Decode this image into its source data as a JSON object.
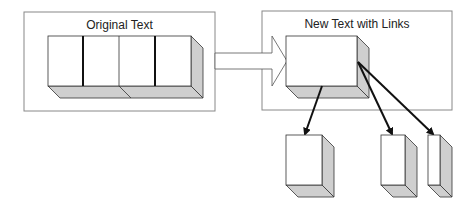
{
  "diagram": {
    "left_panel": {
      "title": "Original Text",
      "segments": 4
    },
    "right_panel": {
      "title": "New Text with Links"
    },
    "link_targets": 3,
    "colors": {
      "face": "#ffffff",
      "shade": "#cfcfcf",
      "stroke": "#111111",
      "panel_border": "#888888"
    }
  }
}
